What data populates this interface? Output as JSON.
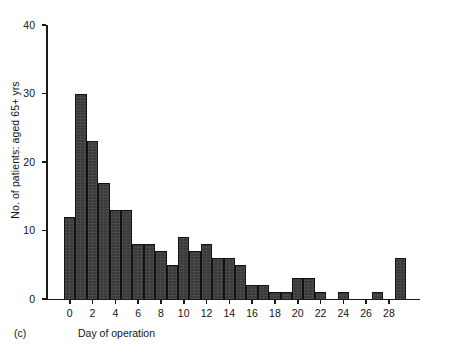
{
  "figure": {
    "panel_tag": "(c)",
    "ylabel": "No. of patients: aged 65+ yrs",
    "xlabel": "Day of operation",
    "bar_color": "#3a3a3a",
    "axis_color": "#1a1a1a",
    "background": "#ffffff"
  },
  "chart_data": {
    "type": "bar",
    "title": "",
    "subtitle": "",
    "xlabel": "Day of operation",
    "ylabel": "No. of patients: aged 65+ yrs",
    "annotations": [
      "(c)"
    ],
    "grid": false,
    "legend": null,
    "xlim": [
      -1,
      30
    ],
    "ylim": [
      0,
      40
    ],
    "ytick_labels": [
      "0",
      "10",
      "20",
      "30",
      "40"
    ],
    "yticks": [
      0,
      10,
      20,
      30,
      40
    ],
    "xtick_labels": [
      "0",
      "2",
      "4",
      "6",
      "8",
      "10",
      "12",
      "14",
      "16",
      "18",
      "20",
      "22",
      "24",
      "26",
      "28"
    ],
    "xticks": [
      0,
      2,
      4,
      6,
      8,
      10,
      12,
      14,
      16,
      18,
      20,
      22,
      24,
      26,
      28
    ],
    "categories": [
      0,
      1,
      2,
      3,
      4,
      5,
      6,
      7,
      8,
      9,
      10,
      11,
      12,
      13,
      14,
      15,
      16,
      17,
      18,
      19,
      20,
      21,
      22,
      23,
      24,
      25,
      26,
      27,
      28,
      29
    ],
    "values": [
      12,
      30,
      23,
      17,
      13,
      13,
      8,
      8,
      7,
      5,
      9,
      7,
      8,
      6,
      6,
      5,
      2,
      2,
      1,
      1,
      3,
      3,
      1,
      0,
      1,
      0,
      0,
      1,
      0,
      6
    ]
  }
}
